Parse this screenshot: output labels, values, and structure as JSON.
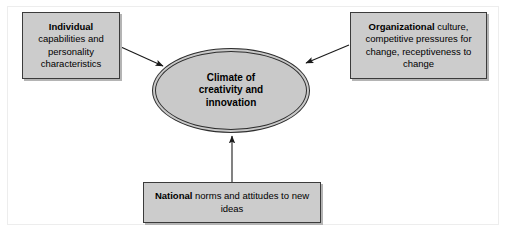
{
  "diagram": {
    "type": "influence-diagram",
    "center": {
      "shape": "ellipse",
      "lines": [
        "Climate of",
        "creativity and",
        "innovation"
      ],
      "fill": "#c9c9c9",
      "stroke": "#2e2e2e"
    },
    "nodes": [
      {
        "id": "individual",
        "position": "top-left",
        "emphasis": "Individual",
        "rest": " capabilities and personality characteristics",
        "lines": [
          "Individual",
          "capabilities and",
          "personality",
          "characteristics"
        ],
        "fill": "#cccccc",
        "stroke": "#3b3b3b"
      },
      {
        "id": "organizational",
        "position": "top-right",
        "emphasis": "Organizational",
        "rest": " culture, competitive pressures for change, receptiveness to change",
        "lines": [
          "Organizational culture,",
          "competitive pressures for",
          "change, receptiveness to",
          "change"
        ],
        "fill": "#cccccc",
        "stroke": "#3b3b3b"
      },
      {
        "id": "national",
        "position": "bottom-center",
        "emphasis": "National",
        "rest": " norms and attitudes to new ideas",
        "lines": [
          "National norms and attitudes to",
          "new ideas"
        ],
        "fill": "#cccccc",
        "stroke": "#3b3b3b"
      }
    ],
    "arrows": [
      {
        "id": "individual-to-climate",
        "from": "individual",
        "to": "center",
        "direction": "down-right"
      },
      {
        "id": "organizational-to-climate",
        "from": "organizational",
        "to": "center",
        "direction": "down-left"
      },
      {
        "id": "national-to-climate",
        "from": "national",
        "to": "center",
        "direction": "up"
      }
    ],
    "arrow_color": "#1a1a1a",
    "background": "#ffffff",
    "frame_color": "#ededed"
  }
}
